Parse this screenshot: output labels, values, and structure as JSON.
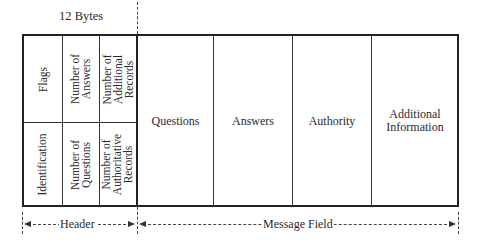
{
  "diagram": {
    "title_annotation": "12 Bytes",
    "header": {
      "label": "Header",
      "top_row": [
        "Flags",
        "Number of\nAnswers",
        "Number of\nAdditional\nRecords"
      ],
      "bottom_row": [
        "Identification",
        "Number of\nQuestions",
        "Number of\nAuthoritative\nRecords"
      ]
    },
    "message_field": {
      "label": "Message Field",
      "sections": [
        "Questions",
        "Answers",
        "Authority",
        "Additional\nInformation"
      ]
    }
  },
  "colors": {
    "line": "#222222",
    "text": "#2a2a2a",
    "background": "#ffffff"
  }
}
